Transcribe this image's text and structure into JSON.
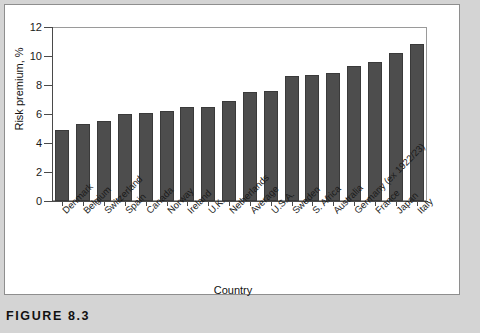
{
  "figure": {
    "caption": "FIGURE 8.3"
  },
  "chart_data": {
    "type": "bar",
    "title": "",
    "xlabel": "Country",
    "ylabel": "Risk premium, %",
    "ylim": [
      0,
      12
    ],
    "ytick_labels": [
      "0",
      "2",
      "4",
      "6",
      "8",
      "10",
      "12"
    ],
    "yticks": [
      0,
      2,
      4,
      6,
      8,
      10,
      12
    ],
    "grid": false,
    "legend": null,
    "bar_color": "#4d4d4d",
    "categories": [
      "Denmark",
      "Belgium",
      "Switzerland",
      "Spain",
      "Canada",
      "Norway",
      "Ireland",
      "U.K.",
      "Netherlands",
      "Average",
      "U.S.A.",
      "Sweden",
      "S. Africa",
      "Australia",
      "Germany (ex 1922/23)",
      "France",
      "Japan",
      "Italy"
    ],
    "values": [
      4.9,
      5.3,
      5.5,
      6.0,
      6.1,
      6.2,
      6.5,
      6.5,
      6.9,
      7.5,
      7.6,
      8.6,
      8.7,
      8.8,
      9.3,
      9.6,
      10.2,
      10.8
    ]
  }
}
